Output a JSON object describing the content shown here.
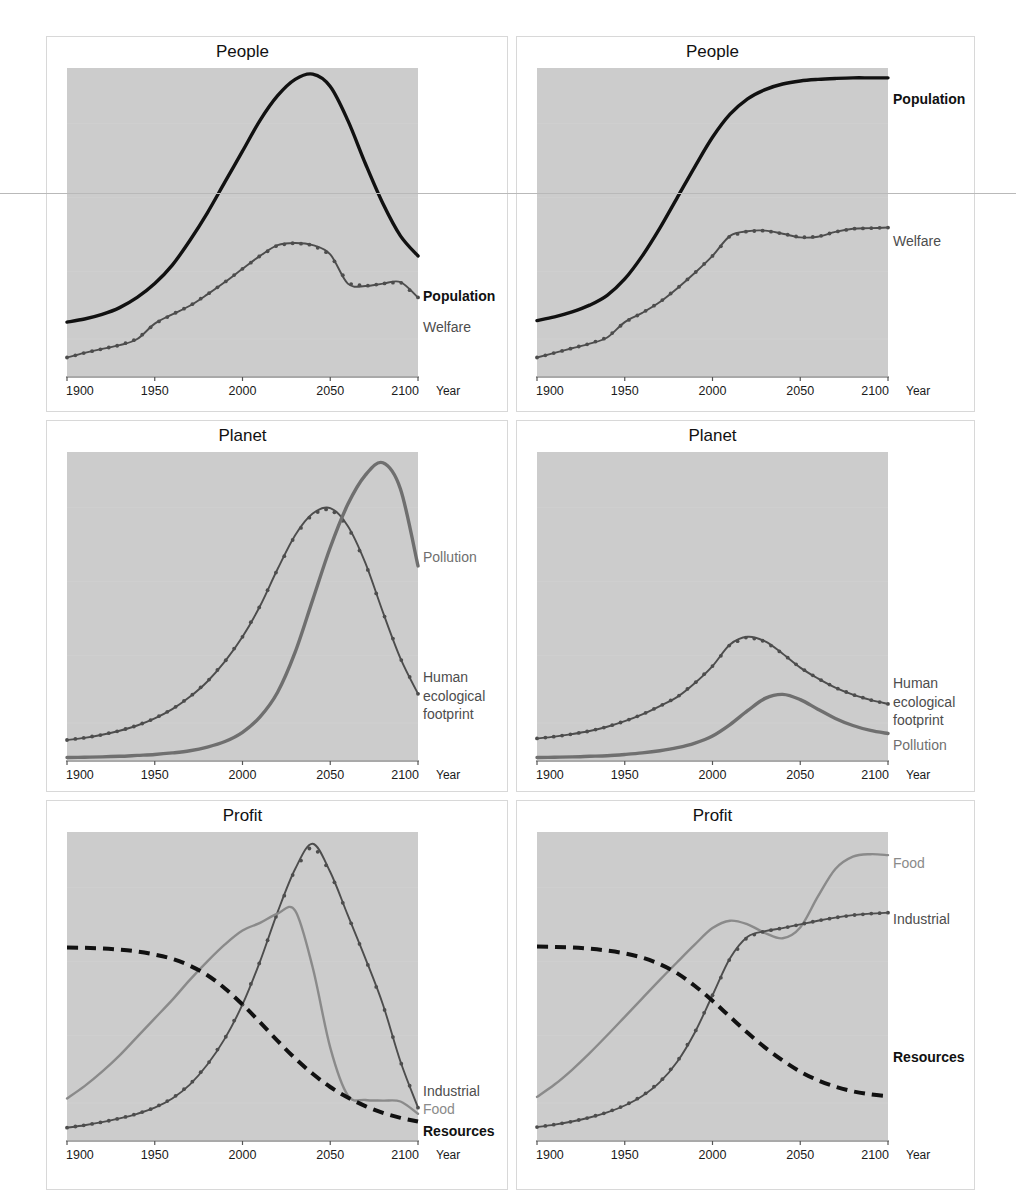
{
  "figure": {
    "background": "#ffffff",
    "plot_background": "#cccccc",
    "panel_border_color": "#d8d8d8",
    "axis_name": "Year",
    "x_ticks": [
      "1900",
      "1950",
      "2000",
      "2050",
      "2100"
    ],
    "x_tick_values": [
      1900,
      1950,
      2000,
      2050,
      2100
    ],
    "colors": {
      "black": "#111111",
      "dark_gray": "#4d4d4d",
      "mid_gray": "#6f6f6f",
      "light_gray": "#8a8a8a"
    }
  },
  "panels": [
    {
      "id": "people-left",
      "title": "People",
      "row": 0,
      "col": 0,
      "labels": [
        {
          "text": "Population",
          "color": "#111111",
          "bold": true,
          "y_frac": 0.745
        },
        {
          "text": "Welfare",
          "color": "#4d4d4d",
          "bold": false,
          "y_frac": 0.845
        }
      ]
    },
    {
      "id": "people-right",
      "title": "People",
      "row": 0,
      "col": 1,
      "labels": [
        {
          "text": "Population",
          "color": "#111111",
          "bold": true,
          "y_frac": 0.105
        },
        {
          "text": "Welfare",
          "color": "#4d4d4d",
          "bold": false,
          "y_frac": 0.565
        }
      ]
    },
    {
      "id": "planet-left",
      "title": "Planet",
      "row": 1,
      "col": 0,
      "labels": [
        {
          "text": "Pollution",
          "color": "#6f6f6f",
          "bold": false,
          "y_frac": 0.345
        },
        {
          "text": "Human",
          "color": "#4d4d4d",
          "bold": false,
          "y_frac": 0.735
        },
        {
          "text": "ecological",
          "color": "#4d4d4d",
          "bold": false,
          "y_frac": 0.795
        },
        {
          "text": "footprint",
          "color": "#4d4d4d",
          "bold": false,
          "y_frac": 0.855
        }
      ]
    },
    {
      "id": "planet-right",
      "title": "Planet",
      "row": 1,
      "col": 1,
      "labels": [
        {
          "text": "Human",
          "color": "#4d4d4d",
          "bold": false,
          "y_frac": 0.755
        },
        {
          "text": "ecological",
          "color": "#4d4d4d",
          "bold": false,
          "y_frac": 0.815
        },
        {
          "text": "footprint",
          "color": "#4d4d4d",
          "bold": false,
          "y_frac": 0.875
        },
        {
          "text": "Pollution",
          "color": "#6f6f6f",
          "bold": false,
          "y_frac": 0.955
        }
      ]
    },
    {
      "id": "profit-left",
      "title": "Profit",
      "row": 2,
      "col": 0,
      "labels": [
        {
          "text": "Industrial",
          "color": "#4d4d4d",
          "bold": false,
          "y_frac": 0.845
        },
        {
          "text": "Food",
          "color": "#8a8a8a",
          "bold": false,
          "y_frac": 0.905
        },
        {
          "text": "Resources",
          "color": "#111111",
          "bold": true,
          "y_frac": 0.975
        }
      ]
    },
    {
      "id": "profit-right",
      "title": "Profit",
      "row": 2,
      "col": 1,
      "labels": [
        {
          "text": "Food",
          "color": "#8a8a8a",
          "bold": false,
          "y_frac": 0.105
        },
        {
          "text": "Industrial",
          "color": "#4d4d4d",
          "bold": false,
          "y_frac": 0.285
        },
        {
          "text": "Resources",
          "color": "#111111",
          "bold": true,
          "y_frac": 0.735
        }
      ]
    }
  ],
  "chart_data": [
    {
      "type": "line",
      "title": "People",
      "panel": "people-left",
      "xlabel": "Year",
      "ylabel": "",
      "xlim": [
        1900,
        2100
      ],
      "ylim": [
        0,
        1
      ],
      "grid": false,
      "x": [
        1900,
        1910,
        1920,
        1930,
        1940,
        1950,
        1960,
        1970,
        1980,
        1990,
        2000,
        2010,
        2020,
        2030,
        2040,
        2050,
        2060,
        2070,
        2080,
        2090,
        2100
      ],
      "series": [
        {
          "name": "Population",
          "style": "solid-thick",
          "color": "#111111",
          "markers": false,
          "values": [
            0.175,
            0.185,
            0.2,
            0.222,
            0.255,
            0.3,
            0.36,
            0.44,
            0.53,
            0.63,
            0.73,
            0.83,
            0.91,
            0.963,
            0.98,
            0.94,
            0.83,
            0.69,
            0.56,
            0.455,
            0.39
          ]
        },
        {
          "name": "Welfare",
          "style": "solid-markers",
          "color": "#4d4d4d",
          "markers": true,
          "values": [
            0.06,
            0.075,
            0.088,
            0.1,
            0.12,
            0.17,
            0.2,
            0.228,
            0.265,
            0.305,
            0.348,
            0.39,
            0.425,
            0.432,
            0.425,
            0.395,
            0.3,
            0.292,
            0.3,
            0.305,
            0.255
          ]
        }
      ]
    },
    {
      "type": "line",
      "title": "People",
      "panel": "people-right",
      "xlabel": "Year",
      "ylabel": "",
      "xlim": [
        1900,
        2100
      ],
      "ylim": [
        0,
        1
      ],
      "grid": false,
      "x": [
        1900,
        1910,
        1920,
        1930,
        1940,
        1950,
        1960,
        1970,
        1980,
        1990,
        2000,
        2010,
        2020,
        2030,
        2040,
        2050,
        2060,
        2070,
        2080,
        2090,
        2100
      ],
      "series": [
        {
          "name": "Population",
          "style": "solid-thick",
          "color": "#111111",
          "markers": false,
          "values": [
            0.18,
            0.192,
            0.208,
            0.23,
            0.262,
            0.315,
            0.39,
            0.48,
            0.58,
            0.68,
            0.775,
            0.85,
            0.9,
            0.93,
            0.948,
            0.958,
            0.963,
            0.966,
            0.968,
            0.968,
            0.968
          ]
        },
        {
          "name": "Welfare",
          "style": "solid-markers",
          "color": "#4d4d4d",
          "markers": true,
          "values": [
            0.06,
            0.075,
            0.09,
            0.105,
            0.125,
            0.175,
            0.205,
            0.24,
            0.285,
            0.335,
            0.39,
            0.455,
            0.47,
            0.472,
            0.462,
            0.45,
            0.452,
            0.468,
            0.478,
            0.48,
            0.482
          ]
        }
      ]
    },
    {
      "type": "line",
      "title": "Planet",
      "panel": "planet-left",
      "xlabel": "Year",
      "ylabel": "",
      "xlim": [
        1900,
        2100
      ],
      "ylim": [
        0,
        1
      ],
      "grid": false,
      "x": [
        1900,
        1910,
        1920,
        1930,
        1940,
        1950,
        1960,
        1970,
        1980,
        1990,
        2000,
        2010,
        2020,
        2030,
        2040,
        2050,
        2060,
        2070,
        2080,
        2090,
        2100
      ],
      "series": [
        {
          "name": "Human ecological footprint",
          "style": "solid-markers",
          "color": "#4d4d4d",
          "markers": true,
          "values": [
            0.065,
            0.072,
            0.082,
            0.095,
            0.112,
            0.135,
            0.165,
            0.205,
            0.255,
            0.32,
            0.4,
            0.5,
            0.62,
            0.73,
            0.8,
            0.818,
            0.76,
            0.64,
            0.48,
            0.33,
            0.215
          ]
        },
        {
          "name": "Pollution",
          "style": "solid-thick",
          "color": "#6f6f6f",
          "markers": false,
          "values": [
            0.008,
            0.009,
            0.01,
            0.012,
            0.015,
            0.018,
            0.023,
            0.03,
            0.042,
            0.06,
            0.09,
            0.14,
            0.22,
            0.35,
            0.52,
            0.69,
            0.83,
            0.925,
            0.965,
            0.88,
            0.63
          ]
        }
      ]
    },
    {
      "type": "line",
      "title": "Planet",
      "panel": "planet-right",
      "xlabel": "Year",
      "ylabel": "",
      "xlim": [
        1900,
        2100
      ],
      "ylim": [
        0,
        1
      ],
      "grid": false,
      "x": [
        1900,
        1910,
        1920,
        1930,
        1940,
        1950,
        1960,
        1970,
        1980,
        1990,
        2000,
        2010,
        2020,
        2030,
        2040,
        2050,
        2060,
        2070,
        2080,
        2090,
        2100
      ],
      "series": [
        {
          "name": "Human ecological footprint",
          "style": "solid-markers",
          "color": "#4d4d4d",
          "markers": true,
          "values": [
            0.07,
            0.076,
            0.084,
            0.094,
            0.108,
            0.126,
            0.148,
            0.175,
            0.205,
            0.25,
            0.305,
            0.375,
            0.4,
            0.385,
            0.345,
            0.3,
            0.265,
            0.235,
            0.212,
            0.195,
            0.182
          ]
        },
        {
          "name": "Pollution",
          "style": "solid-thick",
          "color": "#6f6f6f",
          "markers": false,
          "values": [
            0.008,
            0.009,
            0.01,
            0.012,
            0.014,
            0.018,
            0.023,
            0.03,
            0.04,
            0.055,
            0.078,
            0.115,
            0.16,
            0.2,
            0.213,
            0.196,
            0.165,
            0.135,
            0.112,
            0.096,
            0.086
          ]
        }
      ]
    },
    {
      "type": "line",
      "title": "Profit",
      "panel": "profit-left",
      "xlabel": "Year",
      "ylabel": "",
      "xlim": [
        1900,
        2100
      ],
      "ylim": [
        0,
        1
      ],
      "grid": false,
      "x": [
        1900,
        1910,
        1920,
        1930,
        1940,
        1950,
        1960,
        1970,
        1980,
        1990,
        2000,
        2010,
        2020,
        2030,
        2040,
        2050,
        2060,
        2070,
        2080,
        2090,
        2100
      ],
      "series": [
        {
          "name": "Industrial",
          "style": "solid-markers",
          "color": "#4d4d4d",
          "markers": true,
          "values": [
            0.04,
            0.048,
            0.058,
            0.07,
            0.085,
            0.105,
            0.135,
            0.18,
            0.245,
            0.33,
            0.44,
            0.58,
            0.74,
            0.88,
            0.962,
            0.87,
            0.73,
            0.59,
            0.44,
            0.255,
            0.105
          ]
        },
        {
          "name": "Food",
          "style": "solid-thin",
          "color": "#8a8a8a",
          "markers": false,
          "values": [
            0.135,
            0.175,
            0.222,
            0.275,
            0.335,
            0.395,
            0.455,
            0.52,
            0.58,
            0.635,
            0.68,
            0.705,
            0.735,
            0.745,
            0.56,
            0.3,
            0.145,
            0.13,
            0.128,
            0.125,
            0.085
          ]
        },
        {
          "name": "Resources",
          "style": "dashed",
          "color": "#111111",
          "markers": false,
          "values": [
            0.625,
            0.624,
            0.622,
            0.618,
            0.612,
            0.602,
            0.588,
            0.566,
            0.535,
            0.492,
            0.44,
            0.382,
            0.322,
            0.265,
            0.215,
            0.172,
            0.138,
            0.11,
            0.088,
            0.072,
            0.06
          ]
        }
      ]
    },
    {
      "type": "line",
      "title": "Profit",
      "panel": "profit-right",
      "xlabel": "Year",
      "ylabel": "",
      "xlim": [
        1900,
        2100
      ],
      "ylim": [
        0,
        1
      ],
      "grid": false,
      "x": [
        1900,
        1910,
        1920,
        1930,
        1940,
        1950,
        1960,
        1970,
        1980,
        1990,
        2000,
        2010,
        2020,
        2030,
        2040,
        2050,
        2060,
        2070,
        2080,
        2090,
        2100
      ],
      "series": [
        {
          "name": "Food",
          "style": "solid-thin",
          "color": "#8a8a8a",
          "markers": false,
          "values": [
            0.14,
            0.18,
            0.228,
            0.282,
            0.34,
            0.4,
            0.46,
            0.52,
            0.578,
            0.635,
            0.688,
            0.712,
            0.7,
            0.672,
            0.655,
            0.69,
            0.79,
            0.88,
            0.92,
            0.928,
            0.925
          ]
        },
        {
          "name": "Industrial",
          "style": "solid-markers",
          "color": "#4d4d4d",
          "markers": true,
          "values": [
            0.042,
            0.05,
            0.06,
            0.073,
            0.09,
            0.112,
            0.143,
            0.188,
            0.255,
            0.35,
            0.47,
            0.59,
            0.66,
            0.678,
            0.688,
            0.7,
            0.712,
            0.722,
            0.73,
            0.735,
            0.738
          ]
        },
        {
          "name": "Resources",
          "style": "dashed",
          "color": "#111111",
          "markers": false,
          "values": [
            0.628,
            0.627,
            0.625,
            0.621,
            0.615,
            0.606,
            0.592,
            0.571,
            0.541,
            0.5,
            0.452,
            0.4,
            0.348,
            0.3,
            0.258,
            0.222,
            0.194,
            0.173,
            0.158,
            0.148,
            0.142
          ]
        }
      ]
    }
  ]
}
